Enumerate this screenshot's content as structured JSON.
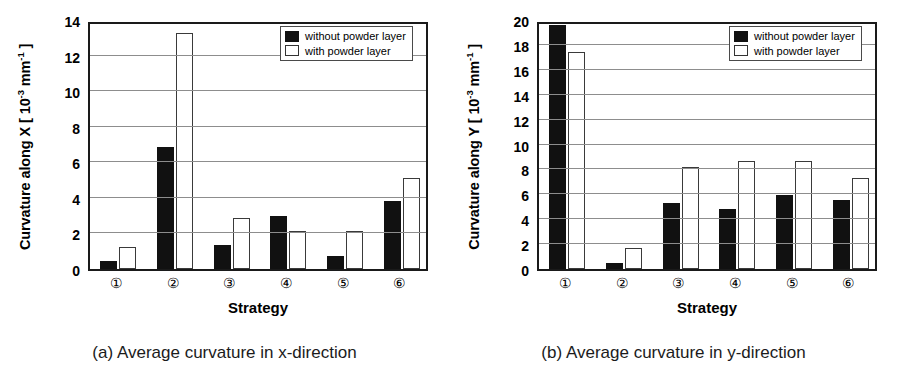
{
  "figure": {
    "panels": [
      {
        "id": "panel-a",
        "caption": "(a) Average curvature in x-direction",
        "ylabel_prefix": "Curvature along X  [ 10",
        "ylabel_exp1": "-3",
        "ylabel_mid": " mm",
        "ylabel_exp2": "-1",
        "ylabel_suffix": " ]",
        "xlabel": "Strategy",
        "legend": [
          {
            "label": "without powder layer",
            "style": "dark"
          },
          {
            "label": "with powder layer",
            "style": "light"
          }
        ]
      },
      {
        "id": "panel-b",
        "caption": "(b) Average curvature in y-direction",
        "ylabel_prefix": "Curvature along Y  [ 10",
        "ylabel_exp1": "-3",
        "ylabel_mid": " mm",
        "ylabel_exp2": "-1",
        "ylabel_suffix": " ]",
        "xlabel": "Strategy",
        "legend": [
          {
            "label": "without powder layer",
            "style": "dark"
          },
          {
            "label": "with powder layer",
            "style": "light"
          }
        ]
      }
    ]
  },
  "chart_data": [
    {
      "type": "bar",
      "panel": "a",
      "title": "(a) Average curvature in x-direction",
      "xlabel": "Strategy",
      "ylabel": "Curvature along X [10^-3 mm^-1]",
      "categories": [
        "①",
        "②",
        "③",
        "④",
        "⑤",
        "⑥"
      ],
      "series": [
        {
          "name": "without powder layer",
          "color": "#111111",
          "values": [
            0.45,
            6.85,
            1.35,
            3.0,
            0.75,
            3.85
          ]
        },
        {
          "name": "with powder layer",
          "color": "#ffffff",
          "values": [
            1.25,
            13.25,
            2.85,
            2.15,
            2.15,
            5.1
          ]
        }
      ],
      "ylim": [
        0,
        14
      ],
      "yticks": [
        0,
        2,
        4,
        6,
        8,
        10,
        12,
        14
      ],
      "grid": true,
      "legend_position": "top-right"
    },
    {
      "type": "bar",
      "panel": "b",
      "title": "(b) Average curvature in y-direction",
      "xlabel": "Strategy",
      "ylabel": "Curvature along Y [10^-3 mm^-1]",
      "categories": [
        "①",
        "②",
        "③",
        "④",
        "⑤",
        "⑥"
      ],
      "series": [
        {
          "name": "without powder layer",
          "color": "#111111",
          "values": [
            19.6,
            0.5,
            5.3,
            4.85,
            5.95,
            5.55
          ]
        },
        {
          "name": "with powder layer",
          "color": "#ffffff",
          "values": [
            17.4,
            1.7,
            8.2,
            8.7,
            8.7,
            7.3
          ]
        }
      ],
      "ylim": [
        0,
        20
      ],
      "yticks": [
        0,
        2,
        4,
        6,
        8,
        10,
        12,
        14,
        16,
        18,
        20
      ],
      "grid": true,
      "legend_position": "top-right"
    }
  ],
  "colors": {
    "bar_dark": "#111111",
    "bar_light": "#ffffff",
    "axis": "#1a1a1a",
    "grid": "#8d8d8d"
  }
}
